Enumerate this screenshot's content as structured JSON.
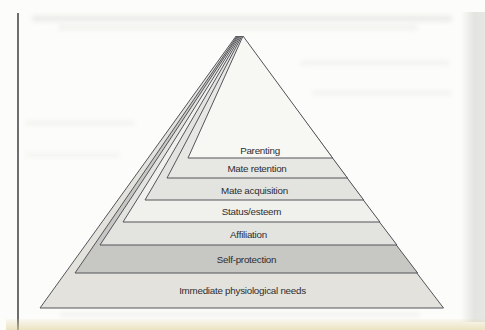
{
  "page": {
    "background_color": "#fcfcfa",
    "left_rule_color": "#6e6e71",
    "right_edge_color": "#e5e5e2",
    "bottom_highlight_color": "#e2d3a0"
  },
  "diagram": {
    "type": "pyramid",
    "line_color": "#54555a",
    "label_color": "#2e2e30",
    "levels": [
      {
        "label": "Parenting",
        "fill": "#f7f7f4"
      },
      {
        "label": "Mate retention",
        "fill": "#e7e7e4"
      },
      {
        "label": "Mate acquisition",
        "fill": "#e3e3e0"
      },
      {
        "label": "Status/esteem",
        "fill": "#f0f0ed"
      },
      {
        "label": "Affiliation",
        "fill": "#e3e3e0"
      },
      {
        "label": "Self-protection",
        "fill": "#c7c7c4"
      },
      {
        "label": "Immediate physiological needs",
        "fill": "#e3e2dd"
      }
    ]
  }
}
